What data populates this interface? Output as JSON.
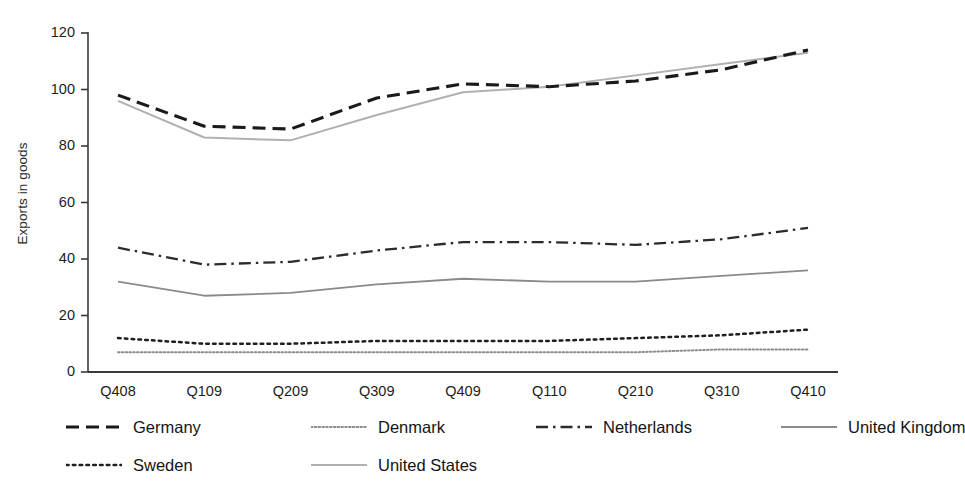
{
  "chart_data": {
    "type": "line",
    "title": "",
    "xlabel": "",
    "ylabel": "Exports in goods",
    "categories": [
      "Q408",
      "Q109",
      "Q209",
      "Q309",
      "Q409",
      "Q110",
      "Q210",
      "Q310",
      "Q410"
    ],
    "ylim": [
      0,
      120
    ],
    "yticks": [
      0,
      20,
      40,
      60,
      80,
      100,
      120
    ],
    "grid": false,
    "legend_position": "bottom",
    "series": [
      {
        "name": "Germany",
        "style": "dashed",
        "color": "#1a1a1a",
        "width": 3.1,
        "values": [
          98,
          87,
          86,
          97,
          102,
          101,
          103,
          107,
          114
        ]
      },
      {
        "name": "Denmark",
        "style": "fine-dotted",
        "color": "#8c8c8c",
        "width": 2.0,
        "values": [
          7,
          7,
          7,
          7,
          7,
          7,
          7,
          8,
          8
        ]
      },
      {
        "name": "Netherlands",
        "style": "dash-dot",
        "color": "#2b2b2b",
        "width": 2.3,
        "values": [
          44,
          38,
          39,
          43,
          46,
          46,
          45,
          47,
          51
        ]
      },
      {
        "name": "United Kingdom",
        "style": "solid",
        "color": "#8a8a8a",
        "width": 1.8,
        "values": [
          32,
          27,
          28,
          31,
          33,
          32,
          32,
          34,
          36
        ]
      },
      {
        "name": "Sweden",
        "style": "dotted",
        "color": "#1f1f1f",
        "width": 2.5,
        "values": [
          12,
          10,
          10,
          11,
          11,
          11,
          12,
          13,
          15
        ]
      },
      {
        "name": "United States",
        "style": "solid",
        "color": "#b0b0b0",
        "width": 2.0,
        "values": [
          96,
          83,
          82,
          91,
          99,
          101,
          105,
          109,
          113
        ]
      }
    ]
  },
  "legend": {
    "rows": [
      [
        {
          "series": "Germany",
          "x": 0
        },
        {
          "series": "Denmark",
          "x": 245
        },
        {
          "series": "Netherlands",
          "x": 470
        },
        {
          "series": "United Kingdom",
          "x": 715
        }
      ],
      [
        {
          "series": "Sweden",
          "x": 0
        },
        {
          "series": "United States",
          "x": 245
        }
      ]
    ]
  },
  "axes": {
    "axis_color": "#3a3a3a",
    "tick_label_color": "#1c1c1c"
  }
}
